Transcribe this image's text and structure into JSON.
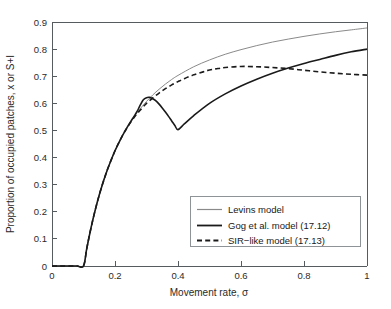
{
  "chart_data": {
    "type": "line",
    "title": "",
    "xlabel": "Movement rate, σ",
    "ylabel": "Proportion of occupied patches, x or S+I",
    "xlim": [
      0,
      1
    ],
    "ylim": [
      0,
      0.9
    ],
    "grid": false,
    "legend_position": "lower-right",
    "xticks": [
      "0",
      "0.2",
      "0.4",
      "0.6",
      "0.8",
      "1"
    ],
    "xtick_values": [
      0,
      0.2,
      0.4,
      0.6,
      0.8,
      1
    ],
    "yticks": [
      "0",
      "0.1",
      "0.2",
      "0.3",
      "0.4",
      "0.5",
      "0.6",
      "0.7",
      "0.8",
      "0.9"
    ],
    "ytick_values": [
      0,
      0.1,
      0.2,
      0.3,
      0.4,
      0.5,
      0.6,
      0.7,
      0.8,
      0.9
    ],
    "series": [
      {
        "name": "Levins model",
        "style": "solid-thin",
        "color": "#8a8a8a",
        "x": [
          0,
          0.02,
          0.04,
          0.06,
          0.08,
          0.1,
          0.11,
          0.12,
          0.13,
          0.14,
          0.15,
          0.16,
          0.17,
          0.18,
          0.2,
          0.22,
          0.24,
          0.26,
          0.28,
          0.3,
          0.32,
          0.34,
          0.36,
          0.38,
          0.4,
          0.45,
          0.5,
          0.55,
          0.6,
          0.65,
          0.7,
          0.75,
          0.8,
          0.85,
          0.9,
          0.95,
          1
        ],
        "values": [
          0,
          0,
          0,
          0,
          0,
          0,
          0.062,
          0.12,
          0.172,
          0.219,
          0.262,
          0.301,
          0.336,
          0.368,
          0.425,
          0.473,
          0.514,
          0.549,
          0.58,
          0.607,
          0.631,
          0.652,
          0.671,
          0.688,
          0.703,
          0.735,
          0.76,
          0.781,
          0.798,
          0.813,
          0.826,
          0.837,
          0.847,
          0.856,
          0.864,
          0.871,
          0.878
        ]
      },
      {
        "name": "Gog et al. model (17.12)",
        "style": "solid-thick",
        "color": "#1a1a1a",
        "x": [
          0,
          0.02,
          0.04,
          0.06,
          0.08,
          0.1,
          0.11,
          0.12,
          0.13,
          0.14,
          0.15,
          0.16,
          0.17,
          0.18,
          0.2,
          0.22,
          0.24,
          0.25,
          0.26,
          0.27,
          0.28,
          0.29,
          0.3,
          0.31,
          0.32,
          0.33,
          0.34,
          0.35,
          0.36,
          0.37,
          0.38,
          0.39,
          0.4,
          0.42,
          0.45,
          0.5,
          0.55,
          0.6,
          0.65,
          0.7,
          0.75,
          0.8,
          0.85,
          0.9,
          0.95,
          1
        ],
        "values": [
          0,
          0,
          0,
          0,
          0,
          0,
          0.062,
          0.12,
          0.172,
          0.219,
          0.262,
          0.301,
          0.336,
          0.368,
          0.425,
          0.473,
          0.514,
          0.533,
          0.551,
          0.57,
          0.593,
          0.613,
          0.621,
          0.622,
          0.617,
          0.609,
          0.597,
          0.583,
          0.568,
          0.552,
          0.535,
          0.518,
          0.503,
          0.524,
          0.555,
          0.6,
          0.635,
          0.664,
          0.689,
          0.711,
          0.73,
          0.747,
          0.762,
          0.777,
          0.79,
          0.8
        ]
      },
      {
        "name": "SIR-like model (17.13)",
        "style": "dashed",
        "color": "#1a1a1a",
        "x": [
          0,
          0.02,
          0.04,
          0.06,
          0.08,
          0.1,
          0.11,
          0.12,
          0.13,
          0.14,
          0.15,
          0.16,
          0.17,
          0.18,
          0.2,
          0.22,
          0.24,
          0.26,
          0.28,
          0.3,
          0.32,
          0.34,
          0.36,
          0.38,
          0.4,
          0.42,
          0.45,
          0.48,
          0.5,
          0.52,
          0.55,
          0.6,
          0.65,
          0.7,
          0.75,
          0.8,
          0.85,
          0.9,
          0.95,
          1
        ],
        "values": [
          0,
          0,
          0,
          0,
          0,
          0,
          0.062,
          0.12,
          0.172,
          0.219,
          0.262,
          0.301,
          0.336,
          0.368,
          0.425,
          0.473,
          0.513,
          0.547,
          0.575,
          0.6,
          0.62,
          0.638,
          0.654,
          0.668,
          0.68,
          0.691,
          0.705,
          0.716,
          0.723,
          0.727,
          0.732,
          0.736,
          0.735,
          0.732,
          0.728,
          0.722,
          0.716,
          0.711,
          0.707,
          0.704
        ]
      }
    ],
    "annotations": {
      "gog_peak": {
        "x": 0.29,
        "y": 0.622
      },
      "gog_trough": {
        "x": 0.4,
        "y": 0.503
      },
      "sir_peak": {
        "x": 0.52,
        "y": 0.78
      },
      "levins_end": {
        "x": 1,
        "y": 0.9
      },
      "gog_end": {
        "x": 1,
        "y": 0.8
      },
      "sir_end": {
        "x": 1,
        "y": 0.73
      }
    }
  },
  "legend": {
    "items": [
      {
        "label": "Levins model"
      },
      {
        "label": "Gog  et al.  model (17.12)"
      },
      {
        "label": "SIR−like model (17.13)"
      }
    ]
  },
  "axes": {
    "x_title": "Movement rate, σ",
    "y_title": "Proportion of occupied patches, x or S+I",
    "x_tick_labels": [
      "0",
      "0.2",
      "0.4",
      "0.6",
      "0.8",
      "1"
    ],
    "y_tick_labels": [
      "0",
      "0.1",
      "0.2",
      "0.3",
      "0.4",
      "0.5",
      "0.6",
      "0.7",
      "0.8",
      "0.9"
    ]
  },
  "colors": {
    "levins": "#8a8a8a",
    "gog": "#1a1a1a",
    "sir": "#1a1a1a",
    "axis": "#555b5e",
    "background": "#ffffff"
  }
}
